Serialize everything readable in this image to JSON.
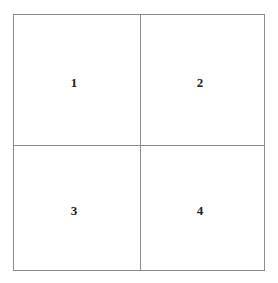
{
  "diagram": {
    "type": "2x2-grid",
    "line_color": "#8a8a8a",
    "text_color": "#222222",
    "cells": [
      {
        "position": "top-left",
        "label": "1"
      },
      {
        "position": "top-right",
        "label": "2"
      },
      {
        "position": "bottom-left",
        "label": "3"
      },
      {
        "position": "bottom-right",
        "label": "4"
      }
    ]
  }
}
